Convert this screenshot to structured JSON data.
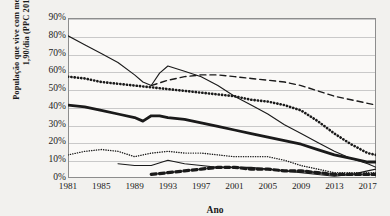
{
  "chart_data": {
    "type": "line",
    "title": "",
    "xlabel": "Ano",
    "ylabel": "População que vive com menos de US$ 1,90/dia (PPC 2011)",
    "xlim": [
      1981,
      2018
    ],
    "ylim": [
      0,
      90
    ],
    "grid": true,
    "legend": "none",
    "y_ticks": [
      "0%",
      "10%",
      "20%",
      "30%",
      "40%",
      "50%",
      "60%",
      "70%",
      "80%",
      "90%"
    ],
    "y_tick_values": [
      0,
      10,
      20,
      30,
      40,
      50,
      60,
      70,
      80,
      90
    ],
    "x_ticks": [
      "1981",
      "1985",
      "1989",
      "1993",
      "1997",
      "2001",
      "2005",
      "2009",
      "2013",
      "2017"
    ],
    "x_tick_values": [
      1981,
      1985,
      1989,
      1993,
      1997,
      2001,
      2005,
      2009,
      2013,
      2017
    ],
    "series": [
      {
        "name": "serie-linha-fina-alta",
        "style": "thin-solid",
        "x": [
          1981,
          1983,
          1985,
          1987,
          1989,
          1990,
          1991,
          1992,
          1993,
          1995,
          1997,
          1999,
          2001,
          2003,
          2005,
          2007,
          2009,
          2011,
          2013,
          2015,
          2017,
          2018
        ],
        "values": [
          80,
          75,
          70,
          65,
          58,
          54,
          52,
          59,
          63,
          60,
          57,
          52,
          46,
          41,
          36,
          30,
          25,
          20,
          15,
          11,
          8,
          6
        ]
      },
      {
        "name": "serie-tracejada",
        "style": "dashed",
        "x": [
          1991,
          1993,
          1995,
          1997,
          1999,
          2001,
          2003,
          2005,
          2007,
          2009,
          2011,
          2013,
          2015,
          2017,
          2018
        ],
        "values": [
          52,
          55,
          57,
          58,
          58,
          57,
          56,
          55,
          54,
          52,
          49,
          46,
          44,
          42,
          41
        ]
      },
      {
        "name": "serie-pontilhada-grossa",
        "style": "dotted-bold",
        "x": [
          1981,
          1983,
          1985,
          1987,
          1989,
          1991,
          1993,
          1995,
          1997,
          1999,
          2001,
          2003,
          2005,
          2007,
          2009,
          2011,
          2013,
          2015,
          2017,
          2018
        ],
        "values": [
          57,
          56,
          54,
          53,
          52,
          51,
          50,
          49,
          48,
          47,
          46,
          44,
          43,
          41,
          38,
          32,
          25,
          19,
          14,
          13
        ]
      },
      {
        "name": "serie-linha-grossa",
        "style": "thick-solid",
        "x": [
          1981,
          1983,
          1985,
          1987,
          1989,
          1990,
          1991,
          1992,
          1993,
          1995,
          1997,
          1999,
          2001,
          2003,
          2005,
          2007,
          2009,
          2011,
          2013,
          2015,
          2017,
          2018
        ],
        "values": [
          41,
          40,
          38,
          36,
          34,
          32,
          35,
          35,
          34,
          33,
          31,
          29,
          27,
          25,
          23,
          21,
          19,
          16,
          13,
          11,
          9,
          9
        ]
      },
      {
        "name": "serie-pontilhada-fina",
        "style": "dotted-thin",
        "x": [
          1981,
          1983,
          1985,
          1987,
          1989,
          1991,
          1993,
          1995,
          1997,
          1999,
          2001,
          2003,
          2005,
          2007,
          2009,
          2011,
          2013,
          2015,
          2017,
          2018
        ],
        "values": [
          13,
          15,
          16,
          15,
          12,
          14,
          15,
          14,
          14,
          13,
          12,
          12,
          12,
          10,
          7,
          5,
          3,
          3,
          3,
          3
        ]
      },
      {
        "name": "serie-tracejada-grossa-baixa",
        "style": "thick-dashed",
        "x": [
          1991,
          1993,
          1995,
          1997,
          1999,
          2001,
          2003,
          2005,
          2007,
          2009,
          2011,
          2013,
          2015,
          2017,
          2018
        ],
        "values": [
          2,
          3,
          4,
          5,
          6,
          6,
          5,
          5,
          4,
          4,
          3,
          2,
          2,
          2,
          2
        ]
      },
      {
        "name": "serie-linha-fina-baixa",
        "style": "thin-solid-low",
        "x": [
          1987,
          1989,
          1991,
          1993,
          1995,
          1997,
          1999,
          2001,
          2003,
          2005,
          2007,
          2009,
          2011,
          2013,
          2015,
          2017,
          2018
        ],
        "values": [
          8,
          7,
          7,
          10,
          8,
          7,
          6,
          6,
          6,
          5,
          4,
          3,
          2,
          1,
          2,
          4,
          5
        ]
      }
    ]
  },
  "axis": {
    "y_title": "População que vive com menos de US$ 1,90/dia (PPC 2011)",
    "x_title": "Ano"
  },
  "colors": {
    "line": "#1a1a1a",
    "grid": "#c9c9c9",
    "frame": "#8d8d8d",
    "page_background": "#f2f1ee",
    "plot_background": "#faf9f7"
  }
}
